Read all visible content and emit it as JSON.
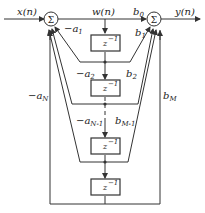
{
  "diagram": {
    "input_label": "x(n)",
    "output_label": "y(n)",
    "state_label": "w(n)",
    "sum_symbol": "Σ",
    "delay_label": "z⁻¹",
    "feedback_coeffs": [
      "-a1",
      "-a2",
      "-aN-1",
      "-aN"
    ],
    "feedforward_coeffs": [
      "b0",
      "b1",
      "b2",
      "bM-1",
      "bM"
    ],
    "delay_count": 4,
    "colors": {
      "line": "#333333",
      "background": "#ffffff"
    }
  },
  "labels": {
    "x": "x(n)",
    "y": "y(n)",
    "w": "w(n)",
    "sigma": "Σ",
    "z_base": "z",
    "z_exp": "−1",
    "a1": "−a",
    "a1_sub": "1",
    "a2": "−a",
    "a2_sub": "2",
    "aN1": "−a",
    "aN1_sub": "N-1",
    "aN": "−a",
    "aN_sub": "N",
    "b0": "b",
    "b0_sub": "0",
    "b1": "b",
    "b1_sub": "1",
    "b2": "b",
    "b2_sub": "2",
    "bM1": "b",
    "bM1_sub": "M-1",
    "bM": "b",
    "bM_sub": "M"
  }
}
